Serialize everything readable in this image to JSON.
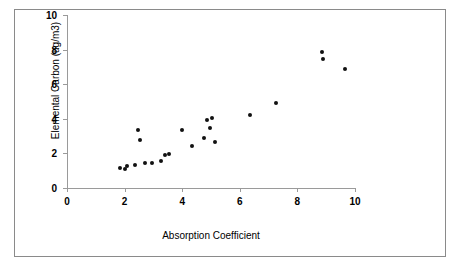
{
  "chart_data": {
    "type": "scatter",
    "title": "",
    "xlabel": "Absorption Coefficient",
    "ylabel": "Elemental Carbon (ug/m3)",
    "xlim": [
      0,
      10
    ],
    "ylim": [
      0,
      10
    ],
    "xticks": [
      "0",
      "2",
      "4",
      "6",
      "8",
      "10"
    ],
    "xtick_values": [
      0,
      2,
      4,
      6,
      8,
      10
    ],
    "yticks": [
      "0",
      "2",
      "4",
      "6",
      "8",
      "10"
    ],
    "ytick_values": [
      0,
      2,
      4,
      6,
      8,
      10
    ],
    "grid": false,
    "legend": false,
    "marker": "filled-diamond",
    "marker_color": "#111111",
    "points": [
      {
        "x": 1.85,
        "y": 1.15
      },
      {
        "x": 2.0,
        "y": 1.1
      },
      {
        "x": 2.1,
        "y": 1.3
      },
      {
        "x": 2.35,
        "y": 1.35
      },
      {
        "x": 2.45,
        "y": 3.35
      },
      {
        "x": 2.55,
        "y": 2.75
      },
      {
        "x": 2.7,
        "y": 1.45
      },
      {
        "x": 2.95,
        "y": 1.45
      },
      {
        "x": 3.25,
        "y": 1.55
      },
      {
        "x": 3.4,
        "y": 1.9
      },
      {
        "x": 3.55,
        "y": 1.95
      },
      {
        "x": 4.0,
        "y": 3.35
      },
      {
        "x": 4.35,
        "y": 2.45
      },
      {
        "x": 4.75,
        "y": 2.9
      },
      {
        "x": 4.85,
        "y": 3.95
      },
      {
        "x": 5.05,
        "y": 4.05
      },
      {
        "x": 4.95,
        "y": 3.45
      },
      {
        "x": 5.15,
        "y": 2.65
      },
      {
        "x": 6.35,
        "y": 4.2
      },
      {
        "x": 7.25,
        "y": 4.9
      },
      {
        "x": 8.85,
        "y": 7.85
      },
      {
        "x": 8.9,
        "y": 7.45
      },
      {
        "x": 9.65,
        "y": 6.9
      }
    ]
  }
}
